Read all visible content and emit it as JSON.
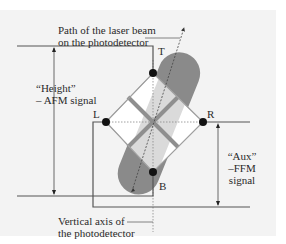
{
  "figure": {
    "labels": {
      "beam_path_line1": "Path of the laser beam",
      "beam_path_line2": "on the photodetector",
      "height_line1": "“Height”",
      "height_line2": "– AFM signal",
      "aux_line1": "“Aux”",
      "aux_line2": "–FFM",
      "aux_line3": "signal",
      "vertical_axis_line1": "Vertical axis of",
      "vertical_axis_line2": "the photodetector"
    },
    "points": {
      "top": "T",
      "left": "L",
      "right": "R",
      "bottom": "B"
    },
    "colors": {
      "background": "#f3f3f3",
      "line": "#555555",
      "spot": "#8a8a8a",
      "spot_light": "#d6d6d6",
      "quadrant_fill": "#ffffff",
      "quadrant_gap": "#8f8f8f",
      "dot": "#111111"
    }
  }
}
